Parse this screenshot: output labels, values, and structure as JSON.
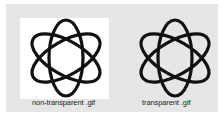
{
  "panels": [
    {
      "id": "non-transparent",
      "label": "non-transparent .gif",
      "background": "#ffffff",
      "icon": "atom-icon"
    },
    {
      "id": "transparent",
      "label": "transparent .gif",
      "background": "transparent",
      "icon": "atom-icon"
    }
  ],
  "colors": {
    "panel_bg": "#e6e6e6",
    "stroke": "#111111",
    "white_box": "#ffffff"
  }
}
